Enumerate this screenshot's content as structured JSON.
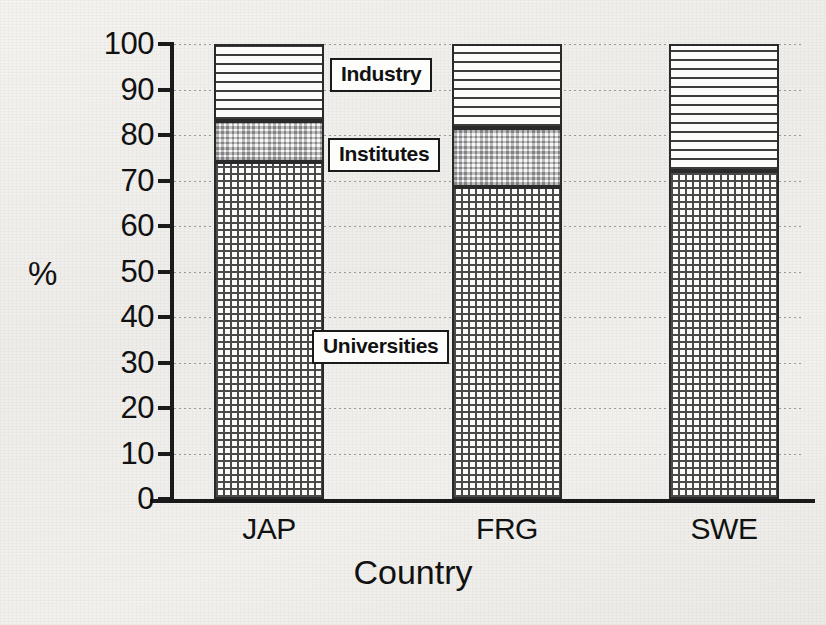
{
  "chart_data": {
    "type": "bar",
    "subtype": "stacked-bar",
    "title": "",
    "xlabel": "Country",
    "ylabel": "%",
    "categories": [
      "JAP",
      "FRG",
      "SWE"
    ],
    "ylim": [
      0,
      100
    ],
    "yticks": [
      0,
      10,
      20,
      30,
      40,
      50,
      60,
      70,
      80,
      90,
      100
    ],
    "ytick_labels": [
      "0",
      "10",
      "20",
      "30",
      "40",
      "50",
      "60",
      "70",
      "80",
      "90",
      "100"
    ],
    "grid": true,
    "grid_axis": "y",
    "grid_style": "dotted",
    "legend_position": "inline-callouts",
    "stack_order_bottom_to_top": [
      "Universities",
      "Institutes",
      "Industry"
    ],
    "series": [
      {
        "name": "Universities",
        "pattern": "fine-grid",
        "values": [
          74,
          68.5,
          72
        ]
      },
      {
        "name": "Institutes",
        "pattern": "checkerboard",
        "values": [
          9,
          13,
          0
        ]
      },
      {
        "name": "Industry",
        "pattern": "horizontal-lines",
        "values": [
          17,
          18.5,
          28
        ]
      }
    ],
    "cumulative_tops": {
      "JAP": {
        "Universities": 74,
        "Institutes": 83,
        "Industry": 100
      },
      "FRG": {
        "Universities": 68.5,
        "Institutes": 81.5,
        "Industry": 100
      },
      "SWE": {
        "Universities": 72,
        "Institutes": 72,
        "Industry": 100
      }
    },
    "annotations": [
      {
        "label": "Industry",
        "x_px": 330,
        "y_px": 58
      },
      {
        "label": "Institutes",
        "x_px": 328,
        "y_px": 138
      },
      {
        "label": "Universities",
        "x_px": 312,
        "y_px": 330
      }
    ]
  },
  "colors": {
    "background": "#f0efec",
    "ink": "#1a1a1a",
    "gridline": "#9a9a96",
    "fill_light": "#fbfbfa"
  }
}
